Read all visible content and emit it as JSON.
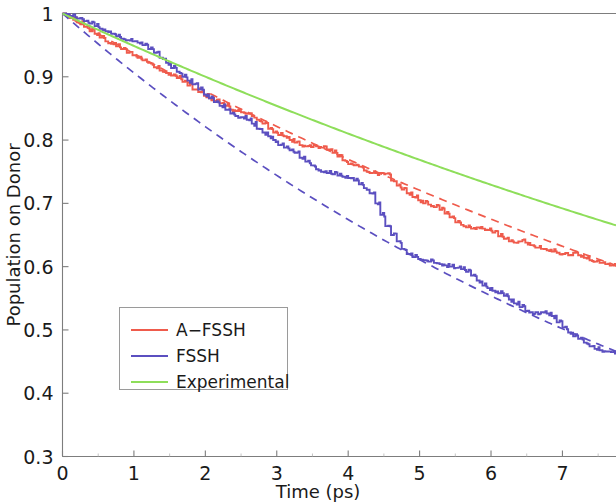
{
  "chart_data": {
    "type": "line",
    "title": "",
    "xlabel": "Time (ps)",
    "ylabel": "Population on Donor",
    "xlim": [
      0,
      7.75
    ],
    "ylim": [
      0.3,
      1.0
    ],
    "xticks": [
      0,
      1,
      2,
      3,
      4,
      5,
      6,
      7
    ],
    "xticklabels": [
      "0",
      "1",
      "2",
      "3",
      "4",
      "5",
      "6",
      "7"
    ],
    "yticks": [
      0.3,
      0.4,
      0.5,
      0.6,
      0.7,
      0.8,
      0.9,
      1.0
    ],
    "yticklabels": [
      "0.3",
      "0.4",
      "0.5",
      "0.6",
      "0.7",
      "0.8",
      "0.9",
      "1"
    ],
    "grid": false,
    "legend_position": "lower-left",
    "series": [
      {
        "name": "A-FSSH",
        "label": "A−FSSH",
        "color": "#ef5b4c",
        "style": "solid-step",
        "x": [
          0.0,
          0.1,
          0.2,
          0.3,
          0.38,
          0.45,
          0.52,
          0.6,
          0.68,
          0.75,
          0.82,
          0.9,
          0.98,
          1.05,
          1.12,
          1.2,
          1.28,
          1.36,
          1.45,
          1.52,
          1.6,
          1.68,
          1.75,
          1.82,
          1.9,
          1.98,
          2.05,
          2.12,
          2.2,
          2.28,
          2.35,
          2.42,
          2.5,
          2.58,
          2.65,
          2.72,
          2.8,
          2.88,
          2.95,
          3.02,
          3.1,
          3.18,
          3.25,
          3.32,
          3.4,
          3.48,
          3.55,
          3.62,
          3.7,
          3.78,
          3.85,
          3.92,
          4.0,
          4.08,
          4.15,
          4.22,
          4.3,
          4.38,
          4.45,
          4.52,
          4.6,
          4.68,
          4.75,
          4.82,
          4.9,
          4.98,
          5.05,
          5.12,
          5.2,
          5.28,
          5.35,
          5.42,
          5.5,
          5.58,
          5.65,
          5.72,
          5.8,
          5.88,
          5.95,
          6.02,
          6.1,
          6.18,
          6.25,
          6.32,
          6.4,
          6.48,
          6.55,
          6.62,
          6.7,
          6.78,
          6.85,
          6.92,
          7.0,
          7.08,
          7.15,
          7.22,
          7.3,
          7.38,
          7.45,
          7.52,
          7.6,
          7.68,
          7.75
        ],
        "y": [
          1.0,
          0.993,
          0.986,
          0.979,
          0.972,
          0.968,
          0.962,
          0.956,
          0.952,
          0.948,
          0.944,
          0.938,
          0.934,
          0.93,
          0.926,
          0.922,
          0.915,
          0.91,
          0.906,
          0.902,
          0.898,
          0.892,
          0.886,
          0.88,
          0.876,
          0.87,
          0.866,
          0.862,
          0.858,
          0.854,
          0.848,
          0.846,
          0.844,
          0.842,
          0.838,
          0.832,
          0.826,
          0.818,
          0.812,
          0.808,
          0.806,
          0.8,
          0.796,
          0.792,
          0.79,
          0.789,
          0.79,
          0.788,
          0.785,
          0.78,
          0.774,
          0.768,
          0.762,
          0.76,
          0.758,
          0.752,
          0.748,
          0.748,
          0.748,
          0.747,
          0.736,
          0.728,
          0.722,
          0.716,
          0.71,
          0.705,
          0.7,
          0.698,
          0.694,
          0.69,
          0.684,
          0.678,
          0.67,
          0.666,
          0.662,
          0.66,
          0.662,
          0.66,
          0.658,
          0.654,
          0.648,
          0.644,
          0.64,
          0.638,
          0.64,
          0.638,
          0.634,
          0.63,
          0.628,
          0.626,
          0.624,
          0.622,
          0.62,
          0.618,
          0.622,
          0.618,
          0.614,
          0.61,
          0.608,
          0.606,
          0.604,
          0.602,
          0.6
        ]
      },
      {
        "name": "A-FSSH-fit",
        "label": "",
        "color": "#ef5b4c",
        "style": "dashed",
        "fit": "exponential",
        "amplitude": 1.0,
        "rate": 0.0655
      },
      {
        "name": "FSSH",
        "label": "FSSH",
        "color": "#5b4fc0",
        "style": "solid-step",
        "x": [
          0.0,
          0.1,
          0.2,
          0.3,
          0.38,
          0.45,
          0.52,
          0.6,
          0.68,
          0.75,
          0.82,
          0.9,
          0.98,
          1.05,
          1.12,
          1.2,
          1.28,
          1.36,
          1.45,
          1.52,
          1.6,
          1.68,
          1.75,
          1.82,
          1.9,
          1.98,
          2.05,
          2.12,
          2.2,
          2.28,
          2.35,
          2.42,
          2.5,
          2.58,
          2.65,
          2.72,
          2.8,
          2.88,
          2.95,
          3.02,
          3.1,
          3.18,
          3.25,
          3.32,
          3.4,
          3.48,
          3.55,
          3.62,
          3.7,
          3.78,
          3.85,
          3.92,
          4.0,
          4.08,
          4.15,
          4.22,
          4.3,
          4.38,
          4.45,
          4.52,
          4.6,
          4.68,
          4.75,
          4.82,
          4.9,
          4.98,
          5.05,
          5.12,
          5.2,
          5.28,
          5.35,
          5.42,
          5.5,
          5.58,
          5.65,
          5.72,
          5.8,
          5.88,
          5.95,
          6.02,
          6.1,
          6.18,
          6.25,
          6.32,
          6.4,
          6.48,
          6.55,
          6.62,
          6.7,
          6.78,
          6.85,
          6.92,
          7.0,
          7.08,
          7.15,
          7.22,
          7.3,
          7.38,
          7.45,
          7.52,
          7.6,
          7.68,
          7.75
        ],
        "y": [
          1.0,
          0.996,
          0.992,
          0.988,
          0.984,
          0.98,
          0.976,
          0.972,
          0.968,
          0.964,
          0.96,
          0.958,
          0.956,
          0.954,
          0.95,
          0.944,
          0.938,
          0.93,
          0.922,
          0.914,
          0.908,
          0.9,
          0.894,
          0.888,
          0.88,
          0.872,
          0.866,
          0.86,
          0.854,
          0.848,
          0.842,
          0.838,
          0.836,
          0.832,
          0.826,
          0.818,
          0.812,
          0.806,
          0.8,
          0.792,
          0.788,
          0.784,
          0.78,
          0.772,
          0.766,
          0.76,
          0.754,
          0.75,
          0.748,
          0.746,
          0.744,
          0.742,
          0.74,
          0.736,
          0.73,
          0.724,
          0.716,
          0.7,
          0.682,
          0.664,
          0.65,
          0.64,
          0.628,
          0.62,
          0.615,
          0.612,
          0.61,
          0.608,
          0.606,
          0.604,
          0.602,
          0.6,
          0.598,
          0.596,
          0.592,
          0.586,
          0.578,
          0.57,
          0.566,
          0.562,
          0.558,
          0.554,
          0.548,
          0.542,
          0.536,
          0.53,
          0.528,
          0.528,
          0.528,
          0.526,
          0.522,
          0.512,
          0.504,
          0.496,
          0.49,
          0.486,
          0.48,
          0.474,
          0.47,
          0.468,
          0.466,
          0.465,
          0.465
        ]
      },
      {
        "name": "FSSH-fit",
        "label": "",
        "color": "#5b4fc0",
        "style": "dashed",
        "fit": "exponential",
        "amplitude": 1.0,
        "rate": 0.0985
      },
      {
        "name": "Experimental",
        "label": "Experimental",
        "color": "#8ede5a",
        "style": "smooth",
        "fit": "exponential",
        "amplitude": 1.0,
        "rate": 0.0526
      }
    ],
    "legend_entries": [
      {
        "label": "A−FSSH",
        "color": "#ef5b4c"
      },
      {
        "label": "FSSH",
        "color": "#5b4fc0"
      },
      {
        "label": "Experimental",
        "color": "#8ede5a"
      }
    ]
  },
  "axes": {
    "x_label": "Time (ps)",
    "y_label": "Population on Donor"
  }
}
